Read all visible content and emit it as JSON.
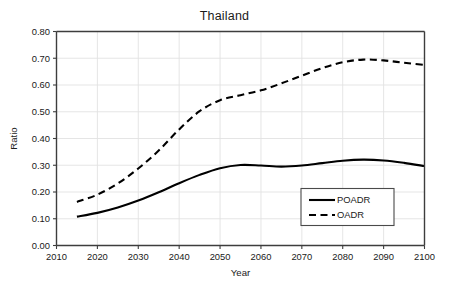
{
  "chart_data": {
    "type": "line",
    "title": "Thailand",
    "xlabel": "Year",
    "ylabel": "Ratio",
    "xlim": [
      2010,
      2100
    ],
    "ylim": [
      0.0,
      0.8
    ],
    "grid": true,
    "legend_position": "bottom-right",
    "xticks": [
      "2010",
      "2020",
      "2030",
      "2040",
      "2050",
      "2060",
      "2070",
      "2080",
      "2090",
      "2100"
    ],
    "xtick_values": [
      2010,
      2020,
      2030,
      2040,
      2050,
      2060,
      2070,
      2080,
      2090,
      2100
    ],
    "yticks": [
      "0.00",
      "0.10",
      "0.20",
      "0.30",
      "0.40",
      "0.50",
      "0.60",
      "0.70",
      "0.80"
    ],
    "ytick_values": [
      0.0,
      0.1,
      0.2,
      0.3,
      0.4,
      0.5,
      0.6,
      0.7,
      0.8
    ],
    "x": [
      2015,
      2020,
      2025,
      2030,
      2035,
      2040,
      2045,
      2050,
      2055,
      2060,
      2065,
      2070,
      2075,
      2080,
      2085,
      2090,
      2095,
      2100
    ],
    "series": [
      {
        "name": "POADR",
        "style": "solid",
        "color": "#000000",
        "values": [
          0.108,
          0.122,
          0.142,
          0.168,
          0.199,
          0.233,
          0.264,
          0.289,
          0.301,
          0.299,
          0.295,
          0.299,
          0.308,
          0.317,
          0.321,
          0.318,
          0.309,
          0.297
        ]
      },
      {
        "name": "OADR",
        "style": "dashed",
        "color": "#000000",
        "values": [
          0.163,
          0.19,
          0.232,
          0.288,
          0.355,
          0.434,
          0.502,
          0.543,
          0.562,
          0.58,
          0.606,
          0.635,
          0.663,
          0.685,
          0.695,
          0.692,
          0.683,
          0.675
        ]
      }
    ]
  },
  "legend": {
    "items": [
      {
        "label": "POADR",
        "style": "solid"
      },
      {
        "label": "OADR",
        "style": "dashed"
      }
    ]
  }
}
